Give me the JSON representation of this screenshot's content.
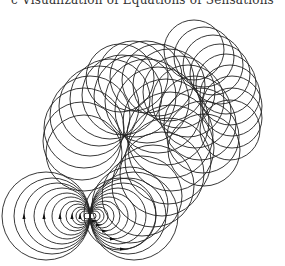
{
  "title": "c Visualization of Equations of Sensations",
  "figure": {
    "stroke_color": "#222222",
    "background": "#ffffff",
    "dipole": {
      "center": [
        90,
        216
      ],
      "radii": [
        3,
        5,
        7,
        9,
        12,
        15,
        19,
        23,
        28,
        33,
        38,
        44
      ],
      "arrow_radii": [
        5,
        9,
        15,
        23,
        33
      ]
    },
    "chain_main": [
      {
        "c": [
          120,
          214
        ],
        "r": 36
      },
      {
        "c": [
          130,
          205
        ],
        "r": 38
      },
      {
        "c": [
          142,
          196
        ],
        "r": 40
      },
      {
        "c": [
          153,
          186
        ],
        "r": 41
      },
      {
        "c": [
          162,
          174
        ],
        "r": 42
      },
      {
        "c": [
          168,
          161
        ],
        "r": 43
      },
      {
        "c": [
          171,
          148
        ],
        "r": 43
      },
      {
        "c": [
          170,
          135
        ],
        "r": 43
      },
      {
        "c": [
          166,
          122
        ],
        "r": 43
      },
      {
        "c": [
          158,
          110
        ],
        "r": 43
      },
      {
        "c": [
          147,
          101
        ],
        "r": 42
      },
      {
        "c": [
          135,
          96
        ],
        "r": 41
      },
      {
        "c": [
          122,
          95
        ],
        "r": 40
      },
      {
        "c": [
          110,
          99
        ],
        "r": 40
      },
      {
        "c": [
          99,
          106
        ],
        "r": 40
      },
      {
        "c": [
          90,
          116
        ],
        "r": 40
      },
      {
        "c": [
          84,
          128
        ],
        "r": 40
      },
      {
        "c": [
          82,
          141
        ],
        "r": 39
      },
      {
        "c": [
          84,
          153
        ],
        "r": 38
      }
    ],
    "chain_upper": [
      {
        "c": [
          120,
          78
        ],
        "r": 34
      },
      {
        "c": [
          133,
          76
        ],
        "r": 35
      },
      {
        "c": [
          146,
          77
        ],
        "r": 36
      },
      {
        "c": [
          158,
          80
        ],
        "r": 36
      },
      {
        "c": [
          169,
          85
        ],
        "r": 36
      },
      {
        "c": [
          179,
          92
        ],
        "r": 36
      },
      {
        "c": [
          188,
          101
        ],
        "r": 36
      },
      {
        "c": [
          195,
          112
        ],
        "r": 36
      },
      {
        "c": [
          200,
          124
        ],
        "r": 36
      },
      {
        "c": [
          203,
          137
        ],
        "r": 36
      },
      {
        "c": [
          204,
          150
        ],
        "r": 36
      }
    ],
    "chain_right": [
      {
        "c": [
          194,
          50
        ],
        "r": 30
      },
      {
        "c": [
          204,
          57
        ],
        "r": 30
      },
      {
        "c": [
          213,
          65
        ],
        "r": 30
      },
      {
        "c": [
          220,
          74
        ],
        "r": 30
      },
      {
        "c": [
          226,
          84
        ],
        "r": 30
      },
      {
        "c": [
          230,
          95
        ],
        "r": 30
      },
      {
        "c": [
          232,
          106
        ],
        "r": 30
      },
      {
        "c": [
          232,
          118
        ],
        "r": 30
      },
      {
        "c": [
          230,
          130
        ],
        "r": 30
      }
    ]
  }
}
